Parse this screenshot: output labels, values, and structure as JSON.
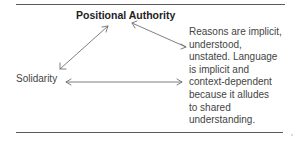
{
  "diagram": {
    "title": "Positional Authority",
    "left_node": "Solidarity",
    "description_lines": [
      "Reasons are implicit,",
      "understood,",
      "unstated. Language",
      "is implicit and",
      "context-dependent",
      "because it alludes",
      "to shared",
      "understanding."
    ],
    "arrows": [
      {
        "from": "Solidarity",
        "to": "Positional Authority",
        "type": "double-headed"
      },
      {
        "from": "Positional Authority",
        "to": "description",
        "type": "double-headed"
      },
      {
        "from": "Solidarity",
        "to": "description",
        "type": "double-headed"
      }
    ],
    "colors": {
      "text": "#444444",
      "title": "#1e1e1e",
      "lines": "#5a5a5a",
      "arrows": "#707070"
    }
  }
}
